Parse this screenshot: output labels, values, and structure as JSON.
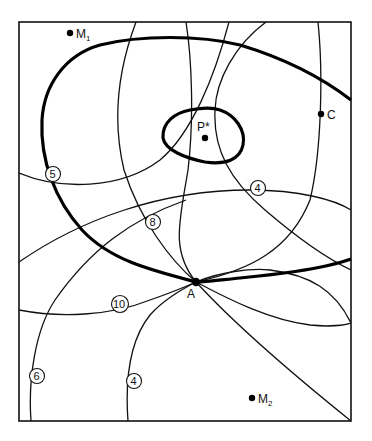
{
  "figure": {
    "points": [
      {
        "id": "M1",
        "label": "M",
        "sub": "1",
        "x": 70,
        "y": 33
      },
      {
        "id": "C",
        "label": "C",
        "sub": "",
        "x": 321,
        "y": 114
      },
      {
        "id": "P*",
        "label": "P*",
        "sub": "",
        "x": 205,
        "y": 138
      },
      {
        "id": "A",
        "label": "A",
        "sub": "",
        "x": 196,
        "y": 282
      },
      {
        "id": "M2",
        "label": "M",
        "sub": "2",
        "x": 252,
        "y": 398
      }
    ],
    "contour_labels": [
      {
        "value": "5",
        "x": 53,
        "y": 174
      },
      {
        "value": "4",
        "x": 258,
        "y": 188
      },
      {
        "value": "8",
        "x": 153,
        "y": 222
      },
      {
        "value": "10",
        "x": 120,
        "y": 304
      },
      {
        "value": "6",
        "x": 37,
        "y": 376
      },
      {
        "value": "4",
        "x": 134,
        "y": 381
      }
    ]
  }
}
